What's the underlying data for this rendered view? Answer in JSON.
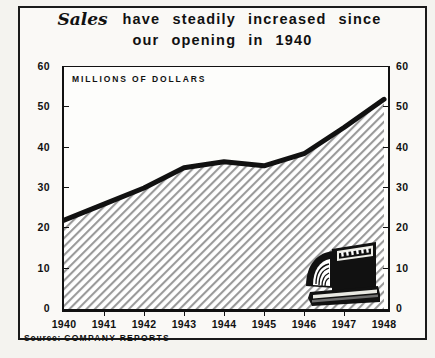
{
  "title": {
    "line1_script": "Sales",
    "line1_rest": [
      "have",
      "steadily",
      "increased",
      "since"
    ],
    "line2": [
      "our",
      "opening",
      "in",
      "1940"
    ]
  },
  "axis_note": "MILLIONS OF DOLLARS",
  "source": {
    "label": "Source:",
    "value": "COMPANY REPORTS"
  },
  "illustration": {
    "name": "cash-register",
    "display_text": "$$$"
  },
  "colors": {
    "ink": "#111111",
    "paper": "#faf9f6",
    "fill_hatch": "#8d8d8d"
  },
  "chart_data": {
    "type": "area",
    "xlabel": "",
    "ylabel": "MILLIONS OF DOLLARS",
    "x": [
      1940,
      1941,
      1942,
      1943,
      1944,
      1945,
      1946,
      1947,
      1948
    ],
    "categories": [
      "1940",
      "1941",
      "1942",
      "1943",
      "1944",
      "1945",
      "1946",
      "1947",
      "1948"
    ],
    "values": [
      22,
      26,
      30,
      35,
      36.5,
      35.5,
      38.5,
      45,
      52
    ],
    "xlim": [
      1940,
      1948
    ],
    "ylim": [
      0,
      60
    ],
    "yticks": [
      0,
      10,
      20,
      30,
      40,
      50,
      60
    ],
    "ytick_labels": [
      "0",
      "10",
      "20",
      "30",
      "40",
      "50",
      "60"
    ],
    "ytick_labels_right": [
      "0",
      "10",
      "20",
      "30",
      "40",
      "50",
      "60"
    ],
    "xticks": [
      1940,
      1941,
      1942,
      1943,
      1944,
      1945,
      1946,
      1947,
      1948
    ],
    "grid": false,
    "legend": "none",
    "line_color": "#111111",
    "fill_pattern": "diagonal-hatch",
    "annotations": [
      "MILLIONS OF DOLLARS"
    ]
  }
}
